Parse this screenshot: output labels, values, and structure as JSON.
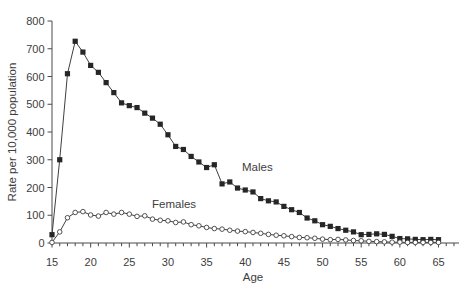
{
  "figure": {
    "y_axis_title": "Rate per 10,000 population",
    "x_axis_title": "Age",
    "males_label": "Males",
    "females_label": "Females"
  },
  "chart_data": {
    "type": "line",
    "title": "",
    "xlabel": "Age",
    "ylabel": "Rate per 10,000 population",
    "x": [
      15,
      16,
      17,
      18,
      19,
      20,
      21,
      22,
      23,
      24,
      25,
      26,
      27,
      28,
      29,
      30,
      31,
      32,
      33,
      34,
      35,
      36,
      37,
      38,
      39,
      40,
      41,
      42,
      43,
      44,
      45,
      46,
      47,
      48,
      49,
      50,
      51,
      52,
      53,
      54,
      55,
      56,
      57,
      58,
      59,
      60,
      61,
      62,
      63,
      64,
      65
    ],
    "series": [
      {
        "name": "Males",
        "marker": "filled-square",
        "line_color": "#3f3f3f",
        "marker_color": "#262626",
        "values": [
          30,
          300,
          610,
          727,
          688,
          640,
          615,
          578,
          542,
          505,
          495,
          488,
          468,
          450,
          428,
          390,
          348,
          337,
          312,
          292,
          272,
          282,
          213,
          220,
          198,
          191,
          184,
          160,
          152,
          148,
          132,
          120,
          110,
          90,
          80,
          66,
          60,
          52,
          46,
          40,
          30,
          31,
          33,
          31,
          24,
          16,
          15,
          13,
          12,
          13,
          12
        ]
      },
      {
        "name": "Females",
        "marker": "open-circle",
        "line_color": "#3f3f3f",
        "marker_color": "#ffffff",
        "marker_stroke": "#404040",
        "values": [
          2,
          40,
          91,
          110,
          113,
          101,
          97,
          110,
          104,
          110,
          104,
          96,
          98,
          86,
          82,
          80,
          74,
          76,
          66,
          62,
          56,
          52,
          50,
          46,
          43,
          41,
          38,
          35,
          31,
          28,
          26,
          23,
          20,
          19,
          17,
          14,
          12,
          13,
          11,
          9,
          8,
          6,
          5,
          4,
          3,
          3,
          2,
          2,
          2,
          2,
          2
        ]
      }
    ],
    "xlim": [
      15,
      65
    ],
    "ylim": [
      0,
      800
    ],
    "x_ticks": [
      15,
      20,
      25,
      30,
      35,
      40,
      45,
      50,
      55,
      60,
      65
    ],
    "y_ticks": [
      0,
      100,
      200,
      300,
      400,
      500,
      600,
      700,
      800
    ],
    "minor_x_tick_step": 1,
    "grid": false,
    "legend": "inline-annotations",
    "annotations": [
      {
        "text": "Males",
        "anchor": "start",
        "age": 39.6,
        "value": 262
      },
      {
        "text": "Females",
        "anchor": "start",
        "age": 28.0,
        "value": 127
      }
    ],
    "axis_color": "#4a4a4a",
    "text_color": "#3d3d3d"
  }
}
